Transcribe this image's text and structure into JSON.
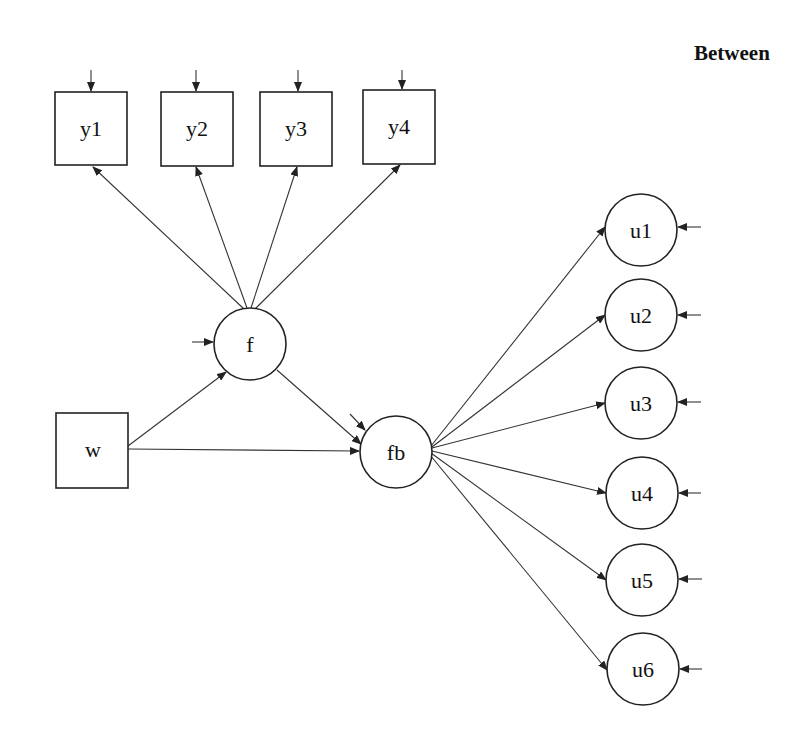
{
  "title": "Between",
  "colors": {
    "stroke": "#222222",
    "background": "#ffffff",
    "text": "#111111"
  },
  "nodes": {
    "y1": {
      "label": "y1",
      "type": "observed"
    },
    "y2": {
      "label": "y2",
      "type": "observed"
    },
    "y3": {
      "label": "y3",
      "type": "observed"
    },
    "y4": {
      "label": "y4",
      "type": "observed"
    },
    "w": {
      "label": "w",
      "type": "observed"
    },
    "f": {
      "label": "f",
      "type": "latent"
    },
    "fb": {
      "label": "fb",
      "type": "latent"
    },
    "u1": {
      "label": "u1",
      "type": "latent"
    },
    "u2": {
      "label": "u2",
      "type": "latent"
    },
    "u3": {
      "label": "u3",
      "type": "latent"
    },
    "u4": {
      "label": "u4",
      "type": "latent"
    },
    "u5": {
      "label": "u5",
      "type": "latent"
    },
    "u6": {
      "label": "u6",
      "type": "latent"
    }
  },
  "edges": [
    {
      "from": "f",
      "to": "y1"
    },
    {
      "from": "f",
      "to": "y2"
    },
    {
      "from": "f",
      "to": "y3"
    },
    {
      "from": "f",
      "to": "y4"
    },
    {
      "from": "w",
      "to": "f"
    },
    {
      "from": "w",
      "to": "fb"
    },
    {
      "from": "f",
      "to": "fb"
    },
    {
      "from": "fb",
      "to": "u1"
    },
    {
      "from": "fb",
      "to": "u2"
    },
    {
      "from": "fb",
      "to": "u3"
    },
    {
      "from": "fb",
      "to": "u4"
    },
    {
      "from": "fb",
      "to": "u5"
    },
    {
      "from": "fb",
      "to": "u6"
    }
  ],
  "residuals": [
    "y1",
    "y2",
    "y3",
    "y4",
    "f",
    "fb",
    "u1",
    "u2",
    "u3",
    "u4",
    "u5",
    "u6"
  ]
}
